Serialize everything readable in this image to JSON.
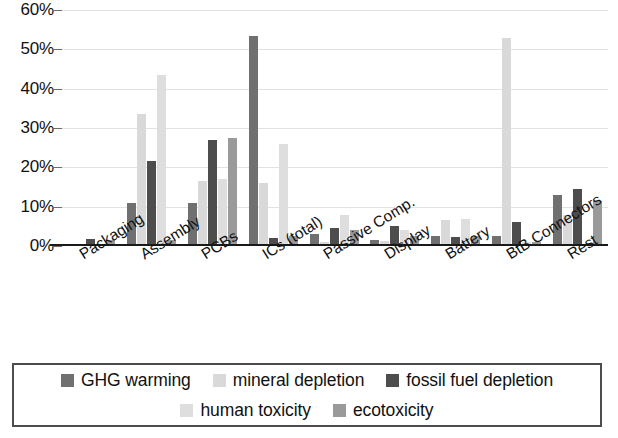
{
  "chart_data": {
    "type": "bar",
    "title": "",
    "subtitle": "",
    "xlabel": "",
    "ylabel": "",
    "ylim": [
      0,
      60
    ],
    "y_tick_labels": [
      "0%",
      "10%",
      "20%",
      "30%",
      "40%",
      "50%",
      "60%"
    ],
    "y_tick_values": [
      0,
      10,
      20,
      30,
      40,
      50,
      60
    ],
    "grid": true,
    "legend_position": "bottom",
    "categories": [
      "Packaging",
      "Assembly",
      "PCBs",
      "ICs (total)",
      "Passive Comp.",
      "Display",
      "Battery",
      "BtB Connectors",
      "Rest"
    ],
    "series": [
      {
        "name": "GHG warming",
        "color": "#707070",
        "values": [
          0.5,
          11.0,
          11.0,
          53.5,
          3.0,
          1.5,
          2.5,
          2.5,
          13.0
        ]
      },
      {
        "name": "mineral depletion",
        "color": "#d9d9d9",
        "values": [
          0.3,
          33.5,
          16.5,
          16.0,
          1.0,
          1.2,
          6.5,
          53.0,
          8.0
        ]
      },
      {
        "name": "fossil fuel depletion",
        "color": "#4d4d4d",
        "values": [
          1.8,
          21.5,
          27.0,
          2.0,
          4.5,
          5.0,
          2.3,
          6.2,
          14.5
        ]
      },
      {
        "name": "human toxicity",
        "color": "#dedede",
        "values": [
          0.4,
          43.5,
          17.0,
          26.0,
          8.0,
          4.0,
          6.8,
          1.0,
          0.5
        ]
      },
      {
        "name": "ecotoxicity",
        "color": "#9a9a9a",
        "values": [
          1.6,
          1.5,
          27.5,
          2.5,
          4.0,
          2.5,
          2.5,
          1.0,
          11.5
        ]
      }
    ]
  },
  "legend": {
    "rows": [
      [
        {
          "label": "GHG warming",
          "color": "#707070"
        },
        {
          "label": "mineral depletion",
          "color": "#d9d9d9"
        },
        {
          "label": "fossil fuel depletion",
          "color": "#4d4d4d"
        }
      ],
      [
        {
          "label": "human toxicity",
          "color": "#dedede"
        },
        {
          "label": "ecotoxicity",
          "color": "#9a9a9a"
        }
      ]
    ]
  }
}
